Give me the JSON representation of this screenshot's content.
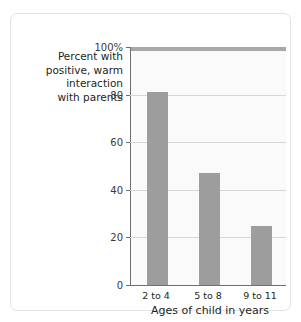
{
  "top_sliver": {
    "left_text": "",
    "right_text": ""
  },
  "chart_data": {
    "type": "bar",
    "title": "",
    "subtitle": "",
    "categories": [
      "2 to 4",
      "5 to 8",
      "9 to 11"
    ],
    "values": [
      81,
      47,
      25
    ],
    "series": [
      {
        "name": "Percent with positive, warm interaction with parents",
        "values": [
          81,
          47,
          25
        ]
      }
    ],
    "xlabel": "Ages of child in years",
    "ylabel_lines": [
      "Percent with",
      "positive, warm",
      "interaction",
      "with parents"
    ],
    "ylim": [
      0,
      100
    ],
    "ytick_values": [
      0,
      20,
      40,
      60,
      80,
      100
    ],
    "ytick_labels": [
      "0",
      "20",
      "40",
      "60",
      "80",
      "100%"
    ],
    "grid": true,
    "legend": "none",
    "bar_color": "#9d9d9d",
    "plot_background": "#fafafa",
    "gridline_color": "#d6d6d6",
    "axis_color": "#6f6f6f",
    "text_color": "#231f20"
  }
}
